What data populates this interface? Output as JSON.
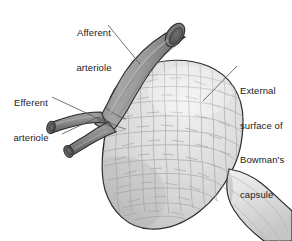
{
  "figure": {
    "type": "anatomical-illustration",
    "width": 292,
    "height": 241,
    "background_color": "#ffffff"
  },
  "labels": {
    "afferent": {
      "line1": "Afferent",
      "line2": "arteriole",
      "name": "afferent-arteriole-label"
    },
    "efferent": {
      "line1": "Efferent",
      "line2": "arteriole",
      "name": "efferent-arteriole-label"
    },
    "capsule": {
      "line1": "External",
      "line2": "surface of",
      "line3": "Bowman's",
      "line4": "capsule",
      "name": "bowmans-capsule-label"
    }
  },
  "colors": {
    "text": "#1a1a1a",
    "leader_line": "#5a5a5a",
    "outline": "#2b2b2b",
    "capsule_fill": "#d8d8d8",
    "capsule_highlight": "#efefef",
    "capsule_shadow": "#bdbdbd",
    "cell_border": "#aaaaaa",
    "arteriole_light": "#a8a8a8",
    "arteriole_mid": "#8a8a8a",
    "arteriole_dark": "#5c5c5c",
    "lumen_dark": "#4a4a4a",
    "lumen_inner": "#6e6e6e",
    "tubule_fill": "#e2e2e2"
  },
  "structures": [
    {
      "name": "afferent-arteriole",
      "description": "Thick vessel entering from upper right with cut elliptical lumen"
    },
    {
      "name": "efferent-arteriole-upper",
      "description": "Smaller branch exiting to lower left with cut lumen"
    },
    {
      "name": "efferent-arteriole-lower",
      "description": "Second smaller branch exiting to lower left with cut lumen"
    },
    {
      "name": "bowmans-capsule",
      "description": "Large rounded mass with cobblestone cellular surface texture"
    },
    {
      "name": "renal-tubule",
      "description": "Smooth neck structure emerging at lower right edge"
    }
  ],
  "leader_lines": [
    {
      "name": "afferent-leader-line",
      "x1": 108,
      "y1": 25,
      "x2": 140,
      "y2": 64
    },
    {
      "name": "efferent-leader-line",
      "x1": 52,
      "y1": 97,
      "x2": 99,
      "y2": 119
    },
    {
      "name": "efferent-leader-line-secondary",
      "x1": 62,
      "y1": 133,
      "x2": 97,
      "y2": 118
    },
    {
      "name": "capsule-leader-line",
      "x1": 237,
      "y1": 66,
      "x2": 203,
      "y2": 101
    }
  ]
}
